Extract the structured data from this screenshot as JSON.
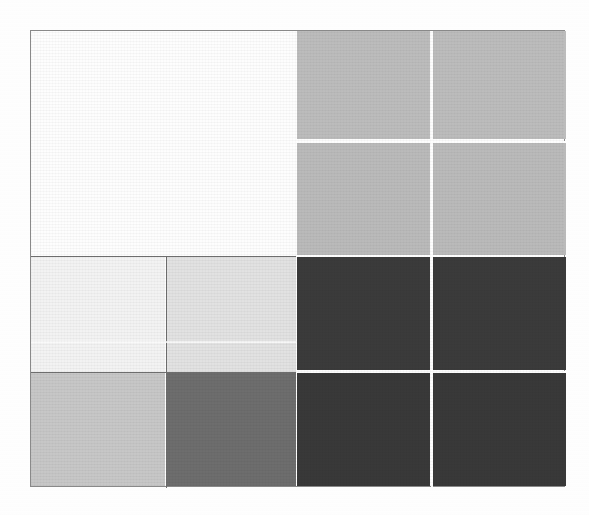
{
  "figure": {
    "kind": "mosaic-grid",
    "background_color": "#ffffff",
    "frame": {
      "x": 30,
      "y": 30,
      "width": 535,
      "height": 457,
      "border_color": "#8a8a8a",
      "border_width_px": 1
    },
    "title": "",
    "subtitle": "",
    "xlabel": "",
    "ylabel": "",
    "legend": [],
    "annotations": []
  },
  "chart_data": {
    "type": "heatmap",
    "title": "",
    "subtitle": "",
    "xlabel": "",
    "ylabel": "",
    "grid": false,
    "legend_position": "none",
    "colorscale": "grayscale",
    "xlabels": [
      "c1",
      "c2",
      "c3",
      "c4"
    ],
    "ylabels": [
      "r1",
      "r2",
      "r3",
      "r4"
    ],
    "x_boundaries_px": [
      30,
      165,
      296,
      430,
      565
    ],
    "y_boundaries_px": [
      30,
      140,
      255,
      340,
      371,
      487
    ],
    "cells": [
      {
        "id": "r1c12",
        "row": "r1",
        "col": "c1-c2",
        "value": 1.0,
        "color": "#ffffff",
        "x": 0,
        "y": 0,
        "w": 265,
        "h": 224,
        "label": ""
      },
      {
        "id": "r1c3",
        "row": "r1",
        "col": "c3",
        "value": 0.74,
        "color": "#bdbdbd",
        "x": 266,
        "y": 0,
        "w": 133,
        "h": 108,
        "label": ""
      },
      {
        "id": "r1c4",
        "row": "r1",
        "col": "c4",
        "value": 0.74,
        "color": "#bdbdbd",
        "x": 401,
        "y": 0,
        "w": 134,
        "h": 108,
        "label": ""
      },
      {
        "id": "r2c3",
        "row": "r2",
        "col": "c3",
        "value": 0.73,
        "color": "#bbbbbb",
        "x": 266,
        "y": 112,
        "w": 133,
        "h": 112,
        "label": ""
      },
      {
        "id": "r2c4",
        "row": "r2",
        "col": "c4",
        "value": 0.73,
        "color": "#bbbbbb",
        "x": 401,
        "y": 112,
        "w": 134,
        "h": 112,
        "label": ""
      },
      {
        "id": "r3c1",
        "row": "r3",
        "col": "c1",
        "value": 0.96,
        "color": "#f4f4f4",
        "x": 0,
        "y": 226,
        "w": 134,
        "h": 115,
        "label": ""
      },
      {
        "id": "r3c2",
        "row": "r3",
        "col": "c2",
        "value": 0.89,
        "color": "#e3e3e3",
        "x": 136,
        "y": 226,
        "w": 129,
        "h": 115,
        "label": ""
      },
      {
        "id": "r3c3",
        "row": "r3",
        "col": "c3",
        "value": 0.23,
        "color": "#3b3b3b",
        "x": 266,
        "y": 226,
        "w": 133,
        "h": 113,
        "label": ""
      },
      {
        "id": "r3c4",
        "row": "r3",
        "col": "c4",
        "value": 0.23,
        "color": "#3b3b3b",
        "x": 401,
        "y": 226,
        "w": 134,
        "h": 113,
        "label": ""
      },
      {
        "id": "r4c1",
        "row": "r4",
        "col": "c1",
        "value": 0.78,
        "color": "#c8c8c8",
        "x": 0,
        "y": 342,
        "w": 134,
        "h": 113,
        "label": ""
      },
      {
        "id": "r4c2",
        "row": "r4",
        "col": "c2",
        "value": 0.43,
        "color": "#6e6e6e",
        "x": 136,
        "y": 342,
        "w": 129,
        "h": 113,
        "label": ""
      },
      {
        "id": "r4c3",
        "row": "r4",
        "col": "c3",
        "value": 0.22,
        "color": "#393939",
        "x": 266,
        "y": 341,
        "w": 133,
        "h": 114,
        "label": ""
      },
      {
        "id": "r4c4",
        "row": "r4",
        "col": "c4",
        "value": 0.22,
        "color": "#393939",
        "x": 401,
        "y": 341,
        "w": 134,
        "h": 114,
        "label": ""
      }
    ],
    "dividers": [
      {
        "id": "v-mid-left",
        "orientation": "vertical",
        "position_px": 165,
        "color": "#6f6f6f",
        "extent": "rows r3-r4"
      },
      {
        "id": "v-right",
        "orientation": "vertical",
        "position_px": 430,
        "color": "#ffffff",
        "extent": "full"
      },
      {
        "id": "h-top-right",
        "orientation": "horizontal",
        "position_px": 140,
        "color": "#ffffff",
        "extent": "cols c3-c4"
      },
      {
        "id": "h-mid",
        "orientation": "horizontal",
        "position_px": 255,
        "color": "#6f6f6f",
        "extent": "cols c1-c2"
      },
      {
        "id": "h-faint",
        "orientation": "horizontal",
        "position_px": 340,
        "color": "#fdfdfd",
        "extent": "cols c1-c2"
      },
      {
        "id": "h-low",
        "orientation": "horizontal",
        "position_px": 371,
        "color": "#6f6f6f",
        "extent": "cols c1-c2"
      },
      {
        "id": "h-low-right",
        "orientation": "horizontal",
        "position_px": 370,
        "color": "#ffffff",
        "extent": "cols c3-c4"
      }
    ]
  }
}
